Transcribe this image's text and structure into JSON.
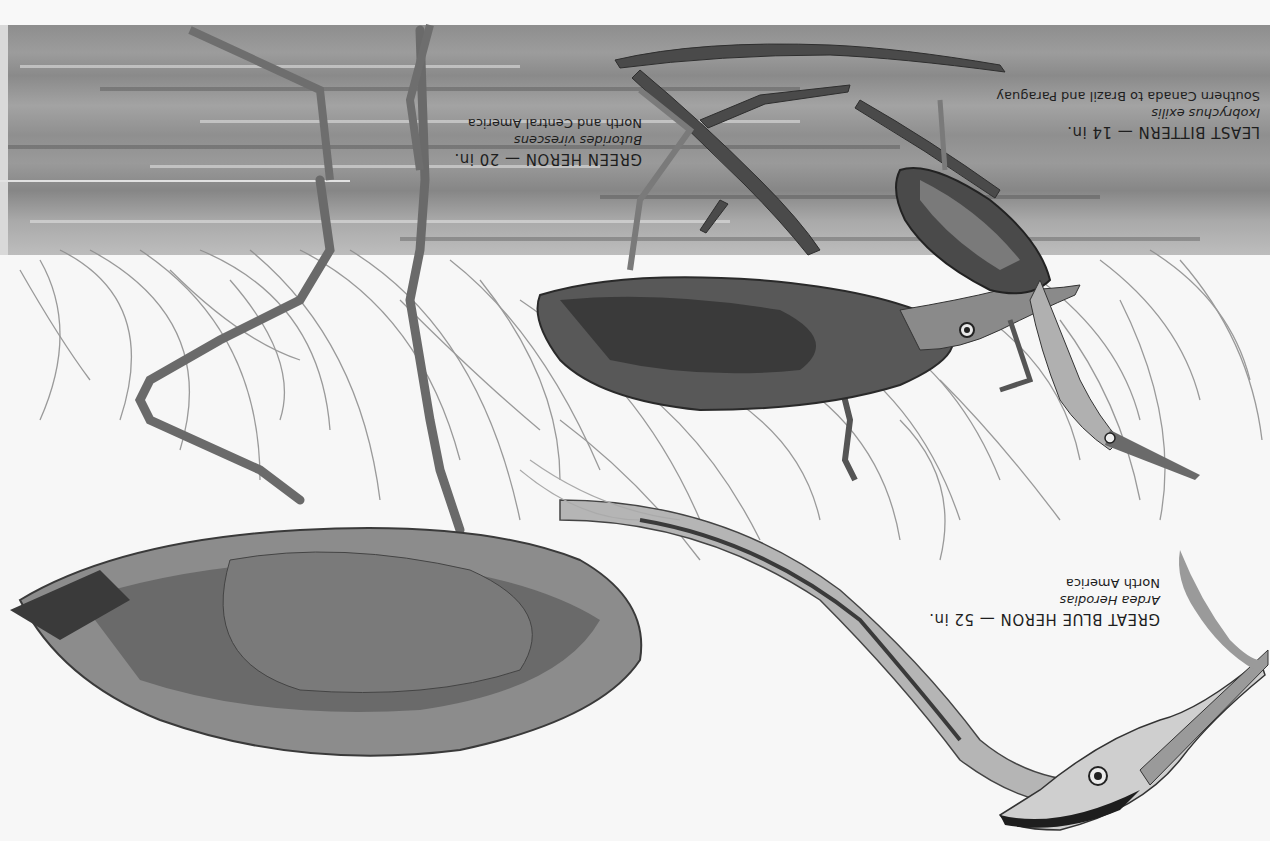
{
  "image": {
    "description": "Grayscale painted illustration plate of three herons wading among marsh grass, shown rotated 180 degrees (upside down)",
    "orientation": "rotated-180",
    "palette": {
      "water": "#959595",
      "paper": "#f6f6f6",
      "ink": "#1e1e1e",
      "dark_plumage": "#2a2a2a",
      "mid_plumage": "#6e6e6e",
      "grass": "#8a8a8a"
    }
  },
  "species": [
    {
      "id": "great-blue-heron",
      "name": "GREAT BLUE HERON — 52 in.",
      "scientific": "Ardea Herodias",
      "range": "North America"
    },
    {
      "id": "green-heron",
      "name": "GREEN HERON — 20 in.",
      "scientific": "Butorides virescens",
      "range": "North and Central America"
    },
    {
      "id": "least-bittern",
      "name": "LEAST BITTERN — 14 in.",
      "scientific": "Ixobrychus exilis",
      "range": "Southern Canada to Brazil and Paraguay"
    }
  ]
}
